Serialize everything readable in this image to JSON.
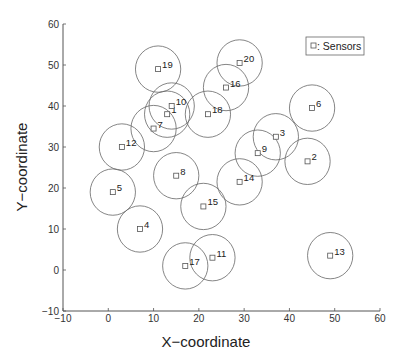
{
  "chart_data": {
    "type": "scatter",
    "title": "",
    "xlabel": "X−coordinate",
    "ylabel": "Y−coordinate",
    "xlim": [
      -10,
      60
    ],
    "ylim": [
      -10,
      60
    ],
    "xticks": [
      -10,
      0,
      10,
      20,
      30,
      40,
      50,
      60
    ],
    "yticks": [
      -10,
      0,
      10,
      20,
      30,
      40,
      50,
      60
    ],
    "grid": false,
    "legend": {
      "position": "upper right",
      "entries": [
        "□ : Sensors"
      ]
    },
    "marker": "square",
    "coverage_radius": 5,
    "series": [
      {
        "name": "Sensors",
        "points": [
          {
            "id": "1",
            "x": 13,
            "y": 38
          },
          {
            "id": "2",
            "x": 44,
            "y": 26.5
          },
          {
            "id": "3",
            "x": 37,
            "y": 32.5
          },
          {
            "id": "4",
            "x": 7,
            "y": 10
          },
          {
            "id": "5",
            "x": 1,
            "y": 19
          },
          {
            "id": "6",
            "x": 45,
            "y": 39.5
          },
          {
            "id": "7",
            "x": 10,
            "y": 34.5
          },
          {
            "id": "8",
            "x": 15,
            "y": 23
          },
          {
            "id": "9",
            "x": 33,
            "y": 28.5
          },
          {
            "id": "10",
            "x": 14,
            "y": 40
          },
          {
            "id": "11",
            "x": 23,
            "y": 3
          },
          {
            "id": "12",
            "x": 3,
            "y": 30
          },
          {
            "id": "13",
            "x": 49,
            "y": 3.5
          },
          {
            "id": "14",
            "x": 29,
            "y": 21.5
          },
          {
            "id": "15",
            "x": 21,
            "y": 15.5
          },
          {
            "id": "16",
            "x": 26,
            "y": 44.5
          },
          {
            "id": "17",
            "x": 17,
            "y": 1
          },
          {
            "id": "18",
            "x": 22,
            "y": 38
          },
          {
            "id": "19",
            "x": 11,
            "y": 49
          },
          {
            "id": "20",
            "x": 29,
            "y": 50.5
          }
        ]
      }
    ]
  },
  "legend": {
    "label": ": Sensors"
  },
  "axes": {
    "xlabel": "X−coordinate",
    "ylabel": "Y−coordinate"
  }
}
